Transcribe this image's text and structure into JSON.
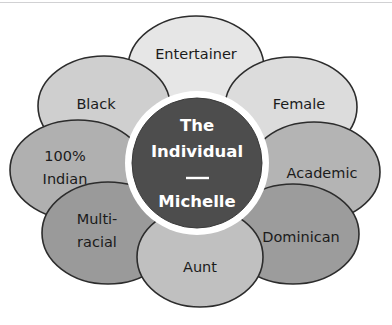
{
  "diagram": {
    "type": "petal-diagram",
    "core": {
      "line1": "The",
      "line2": "Individual",
      "divider": "—",
      "line3": "Michelle",
      "fill_color": "#4d4d4d",
      "text_color": "#ffffff",
      "ring_color": "#ffffff"
    },
    "petals": [
      {
        "label": "Entertainer",
        "fill_color": "#e6e6e6",
        "text_color": "#1b1b1b"
      },
      {
        "label": "Female",
        "fill_color": "#dcdcdc",
        "text_color": "#1b1b1b"
      },
      {
        "label": "Academic",
        "fill_color": "#b4b4b4",
        "text_color": "#1b1b1b"
      },
      {
        "label": "Dominican",
        "fill_color": "#9c9c9c",
        "text_color": "#1b1b1b"
      },
      {
        "label": "Aunt",
        "fill_color": "#c0c0c0",
        "text_color": "#1b1b1b"
      },
      {
        "label_line1": "Multi-",
        "label_line2": "racial",
        "label": "Multi-racial",
        "fill_color": "#9a9a9a",
        "text_color": "#1b1b1b"
      },
      {
        "label_line1": "100%",
        "label_line2": "Indian",
        "label": "100% Indian",
        "fill_color": "#b0b0b0",
        "text_color": "#1b1b1b"
      },
      {
        "label": "Black",
        "fill_color": "#cfcfcf",
        "text_color": "#1b1b1b"
      }
    ],
    "outline_color": "#2c2c2c",
    "background_color": "#ffffff"
  }
}
